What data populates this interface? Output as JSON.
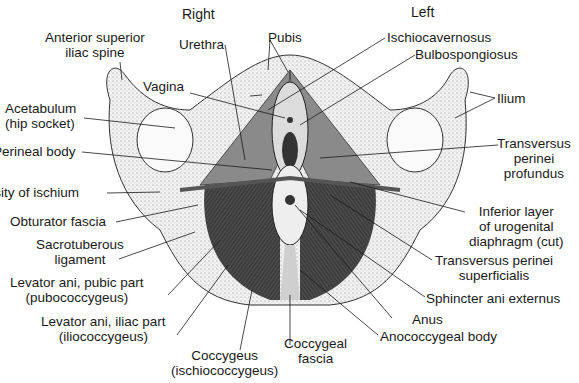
{
  "diagram": {
    "orientation": {
      "right": "Right",
      "left": "Left"
    },
    "colors": {
      "ink": "#1a1a1a",
      "bone": "#e6e6e6",
      "muscle": "#3a3a3a",
      "background": "#ffffff"
    },
    "labels": {
      "asis": [
        "Anterior superior",
        "iliac spine"
      ],
      "urethra": "Urethra",
      "pubis": "Pubis",
      "ischiocavernosus": "Ischiocavernosus",
      "bulbospongiosus": "Bulbospongiosus",
      "vagina": "Vagina",
      "ilium": "Ilium",
      "acetabulum": [
        "Acetabulum",
        "(hip socket)"
      ],
      "perineal_body": "Perineal body",
      "tpp": [
        "Transversus",
        "perinei",
        "profundus"
      ],
      "tuberosity": "Tuberosity of ischium",
      "obturator": "Obturator fascia",
      "inferior_layer": [
        "Inferior layer",
        "of urogenital",
        "diaphragm (cut)"
      ],
      "sacrotuberous": [
        "Sacrotuberous",
        "ligament"
      ],
      "tps": [
        "Transversus perinei",
        "superficialis"
      ],
      "pubic_part": [
        "Levator ani, pubic part",
        "(pubococcygeus)"
      ],
      "sphincter": "Sphincter ani externus",
      "anus": "Anus",
      "iliac_part": [
        "Levator ani, iliac part",
        "(iliococcygeus)"
      ],
      "anococcygeal": "Anococcygeal body",
      "coccygeus": [
        "Coccygeus",
        "(ischiococcygeus)"
      ],
      "coccygeal_fascia": [
        "Coccygeal",
        "fascia"
      ]
    }
  }
}
